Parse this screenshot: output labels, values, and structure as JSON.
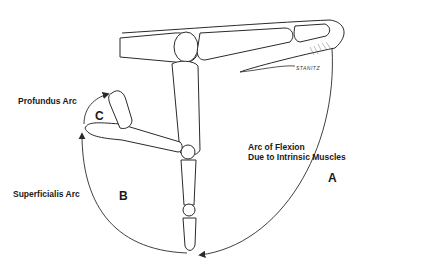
{
  "diagram": {
    "labels": {
      "profundus_arc": "Profundus Arc",
      "superficialis_arc": "Superficialis Arc",
      "intrinsic_line1": "Arc of Flexion",
      "intrinsic_line2": "Due to Intrinsic Muscles",
      "region_a": "A",
      "region_b": "B",
      "region_c": "C",
      "signature": "STANITZ"
    },
    "colors": {
      "line": "#2a2a2a",
      "bone_fill": "#ffffff",
      "stipple": "#9a9a9a",
      "background": "#ffffff"
    }
  }
}
